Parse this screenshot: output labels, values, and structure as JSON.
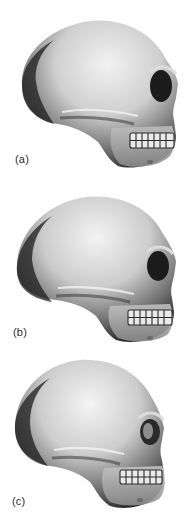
{
  "figure": {
    "panels": [
      {
        "id": "a",
        "label": "(a)",
        "subject": "skull-lateral-view",
        "description": "Skull in left-facing lateral view, elongated cranial vault, prominent brow, visible teeth"
      },
      {
        "id": "b",
        "label": "(b)",
        "subject": "skull-lateral-view",
        "description": "Skull in lateral view, slightly higher vault, prominent brow and teeth"
      },
      {
        "id": "c",
        "label": "(c)",
        "subject": "skull-lateral-view",
        "description": "Skull in lateral view, rounded vault, smaller face and teeth"
      }
    ],
    "colors": {
      "background": "#ffffff",
      "bone_light": "#e8e8e8",
      "bone_mid": "#a8a8a8",
      "bone_dark": "#3a3a3a",
      "shadow": "#1a1a1a",
      "label": "#2b2b2b"
    }
  }
}
